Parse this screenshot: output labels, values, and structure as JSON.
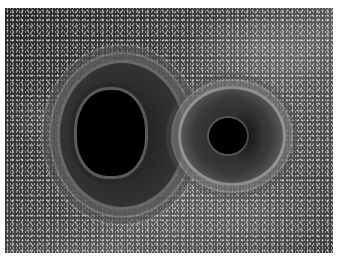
{
  "image": {
    "description": "Simulation rendering of two black holes orbiting each other, with gravitationally lensed star field swirling around them",
    "subjects": [
      {
        "name": "larger-black-hole",
        "position": "center-left",
        "shape": "vertical oval"
      },
      {
        "name": "smaller-black-hole",
        "position": "center-right",
        "shape": "circle"
      }
    ],
    "palette": {
      "background": "#3c3c3c",
      "core": "#000000",
      "stars": "#ffffff",
      "border": "#ffffff"
    }
  }
}
